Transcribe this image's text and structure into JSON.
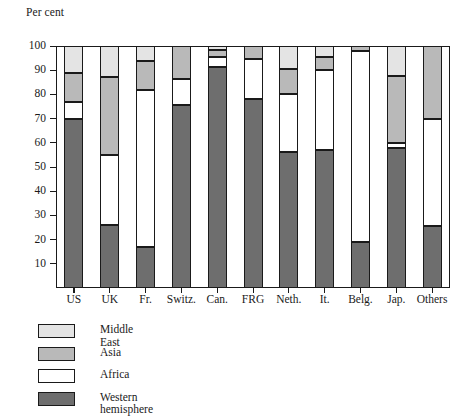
{
  "chart_data": {
    "type": "bar",
    "subtype": "stacked-100-percent",
    "title": "",
    "xlabel": "",
    "ylabel": "Per cent",
    "ylim": [
      0,
      100
    ],
    "yticks": [
      10,
      20,
      30,
      40,
      50,
      60,
      70,
      80,
      90,
      100
    ],
    "ytick_labels": [
      "10",
      "20",
      "30",
      "40",
      "50",
      "60",
      "70",
      "80",
      "90",
      "100"
    ],
    "grid": false,
    "legend_position": "below-left",
    "categories": [
      "US",
      "UK",
      "Fr.",
      "Switz.",
      "Can.",
      "FRG",
      "Neth.",
      "It.",
      "Belg.",
      "Jap.",
      "Others"
    ],
    "series": [
      {
        "name": "Western hemisphere",
        "color": "#6e6e6e",
        "values": [
          70,
          26,
          17,
          75.5,
          91.5,
          78,
          56,
          57,
          19,
          58,
          25.5
        ]
      },
      {
        "name": "Africa",
        "color": "#ffffff",
        "values": [
          7,
          29,
          65,
          11,
          4,
          16.5,
          24,
          33,
          79,
          2,
          44.5
        ]
      },
      {
        "name": "Asia",
        "color": "#b9b9b9",
        "values": [
          12,
          32,
          12,
          13.5,
          3,
          5.5,
          10.5,
          5.5,
          2,
          27.5,
          30
        ]
      },
      {
        "name": "Middle East",
        "color": "#e4e4e4",
        "values": [
          11,
          13,
          6,
          0,
          1.5,
          0,
          9.5,
          4.5,
          0,
          12.5,
          0
        ]
      }
    ],
    "cumulative_tops": {
      "US": {
        "western_hemisphere": 70,
        "africa": 77,
        "asia": 89,
        "middle_east": 100
      },
      "UK": {
        "western_hemisphere": 26,
        "africa": 55,
        "asia": 87,
        "middle_east": 100
      },
      "Fr.": {
        "western_hemisphere": 17,
        "africa": 82,
        "asia": 94,
        "middle_east": 100
      },
      "Switz.": {
        "western_hemisphere": 75.5,
        "africa": 86.5,
        "asia": 100,
        "middle_east": 100
      },
      "Can.": {
        "western_hemisphere": 91.5,
        "africa": 95.5,
        "asia": 98.5,
        "middle_east": 100
      },
      "FRG": {
        "western_hemisphere": 78,
        "africa": 94.5,
        "asia": 100,
        "middle_east": 100
      },
      "Neth.": {
        "western_hemisphere": 56,
        "africa": 80,
        "asia": 90.5,
        "middle_east": 100
      },
      "It.": {
        "western_hemisphere": 57,
        "africa": 90,
        "asia": 95.5,
        "middle_east": 100
      },
      "Belg.": {
        "western_hemisphere": 19,
        "africa": 98,
        "asia": 100,
        "middle_east": 100
      },
      "Jap.": {
        "western_hemisphere": 58,
        "africa": 60,
        "asia": 87.5,
        "middle_east": 100
      },
      "Others": {
        "western_hemisphere": 25.5,
        "africa": 70,
        "asia": 100,
        "middle_east": 100
      }
    }
  },
  "legend": {
    "items": [
      {
        "label": "Middle East",
        "key": "middle_east"
      },
      {
        "label": "Asia",
        "key": "asia"
      },
      {
        "label": "Africa",
        "key": "africa"
      },
      {
        "label": "Western\nhemisphere",
        "key": "western_hemisphere"
      }
    ]
  },
  "colors": {
    "middle_east": "#e4e4e4",
    "asia": "#b9b9b9",
    "africa": "#ffffff",
    "western_hemisphere": "#6e6e6e",
    "axis": "#1a1a1a",
    "background": "#ffffff"
  }
}
